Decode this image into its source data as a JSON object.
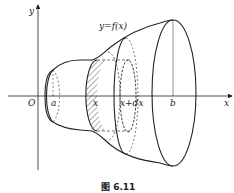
{
  "figure": {
    "caption": "图 6.11",
    "axes": {
      "x_label": "x",
      "y_label": "y",
      "origin_label": "O"
    },
    "curve_label": "y=f(x)",
    "tick_labels": {
      "a": "a",
      "x": "x",
      "x_plus_dx": "x+dx",
      "b": "b"
    },
    "colors": {
      "stroke": "#222222",
      "background": "#ffffff"
    }
  }
}
